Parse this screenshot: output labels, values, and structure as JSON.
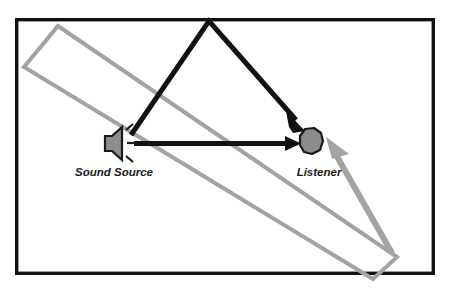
{
  "diagram": {
    "room": {
      "name": "room-boundary",
      "stroke_color": "#111111",
      "stroke_width": 3.5,
      "x": 15,
      "y": 18,
      "width": 420,
      "height": 257
    },
    "nodes": [
      {
        "id": "sound-source",
        "label": "Sound Source",
        "icon": "speaker-icon",
        "x": 116,
        "y": 143,
        "label_x": 114,
        "label_y": 175,
        "body_color": "#8c8c8c",
        "outline_color": "#1a1a1a"
      },
      {
        "id": "listener",
        "label": "Listener",
        "icon": "listener-head-icon",
        "x": 311,
        "y": 141,
        "label_x": 318,
        "label_y": 175,
        "body_color": "#8c8c8c",
        "outline_color": "#1a1a1a"
      }
    ],
    "paths": [
      {
        "id": "direct-path",
        "name": "direct-sound-path-arrow",
        "kind": "direct",
        "color": "#111111",
        "stroke_width": 5,
        "points": "134,143 295,143",
        "arrowhead": "filled-triangle"
      },
      {
        "id": "reflected-path",
        "name": "reflected-sound-path-arrow",
        "kind": "reflected",
        "color": "#111111",
        "stroke_width": 5,
        "points": "131,135 209,21 299,124",
        "arrowhead": "filled-triangle",
        "reflection_point_x": 209,
        "reflection_point_y": 21
      }
    ],
    "barrier": {
      "id": "angled-wall",
      "name": "angled-reflective-wall",
      "color": "#a3a3a3",
      "stroke_width": 4,
      "corners": "58,26 397,257 373,279 24,67",
      "arrow_tip_x": 325,
      "arrow_tip_y": 146,
      "arrowhead_points": "325,146 355,151 347,176"
    },
    "legend_colors": {
      "direct": "#111111",
      "reflected": "#111111",
      "wall": "#a3a3a3",
      "icon_fill": "#8c8c8c",
      "background": "#ffffff"
    }
  }
}
